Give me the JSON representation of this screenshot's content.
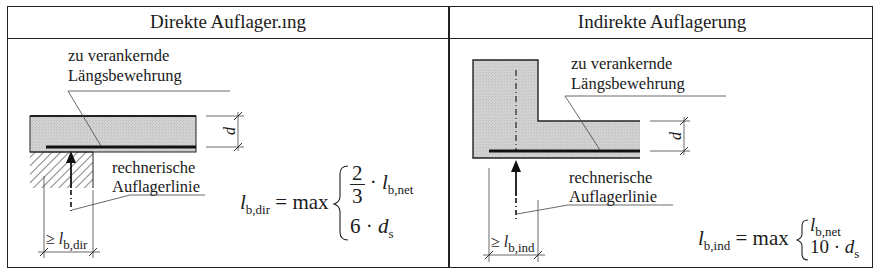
{
  "table": {
    "columns": [
      {
        "title": "Direkte Auflager.ıng",
        "label_reinforcement_line1": "zu verankernde",
        "label_reinforcement_line2": "Längsbewehrung",
        "label_support_line1": "rechnerische",
        "label_support_line2": "Auflagerlinie",
        "dimension_depth": "d",
        "dimension_length_prefix": "≥",
        "dimension_length_symbol": "l",
        "dimension_length_sub": "b,dir",
        "formula": {
          "lhs_symbol": "l",
          "lhs_sub": "b,dir",
          "equals_max": "= max",
          "case1_num": "2",
          "case1_den": "3",
          "case1_op": "·",
          "case1_symbol": "l",
          "case1_sub": "b,net",
          "case2_factor": "6 ·",
          "case2_symbol": "d",
          "case2_sub": "s"
        }
      },
      {
        "title": "Indirekte Auflagerung",
        "label_reinforcement_line1": "zu verankernde",
        "label_reinforcement_line2": "Längsbewehrung",
        "label_support_line1": "rechnerische",
        "label_support_line2": "Auflagerlinie",
        "dimension_depth": "d",
        "dimension_length_prefix": "≥",
        "dimension_length_symbol": "l",
        "dimension_length_sub": "b,ind",
        "formula": {
          "lhs_symbol": "l",
          "lhs_sub": "b,ind",
          "equals_max": "= max",
          "case1_symbol": "l",
          "case1_sub": "b,net",
          "case2_factor": "10 ·",
          "case2_symbol": "d",
          "case2_sub": "s"
        }
      }
    ]
  },
  "colors": {
    "concrete_fill": "#cfcfcf",
    "line": "#222222",
    "background": "#ffffff"
  }
}
